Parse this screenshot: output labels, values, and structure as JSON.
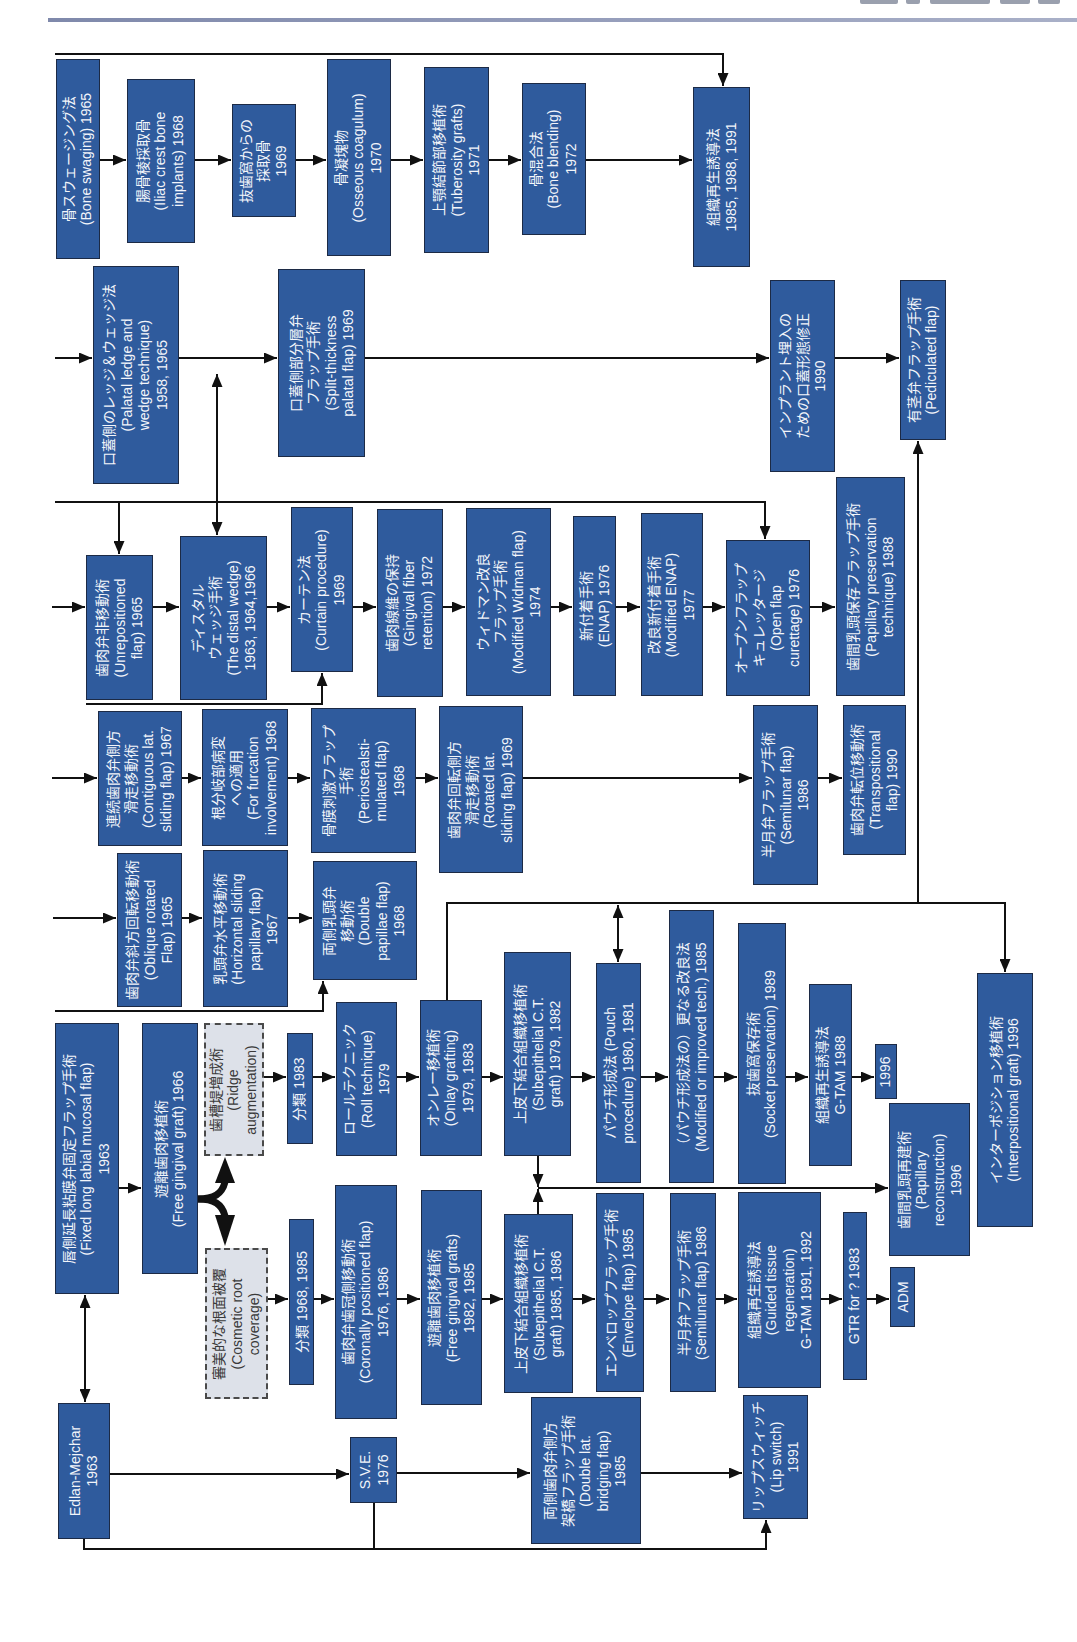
{
  "header": {
    "rule_color": "#8a93b3"
  },
  "colors": {
    "box_fill": "#2f5b9d",
    "box_border": "#1c2a45",
    "box_text": "#f3f5fa",
    "dashed_fill": "#dde1e9",
    "line": "#111111"
  },
  "nodes": {
    "bone_swaging": "骨スウェージング法\n(Bone swaging) 1965",
    "iliac_crest": "腸骨稜採取骨\n(Iliac crest bone\nimplants) 1968",
    "extraction_socket_bone": "抜歯窩からの\n採取骨\n1969",
    "osseous_coagulum": "骨凝塊物\n(Osseous coagulum)\n1970",
    "tuberosity_grafts": "上顎結節部移植術\n(Tuberosity grafts)\n1971",
    "bone_blending": "骨混合法\n(Bone blending)\n1972",
    "gtr_bone": "組織再生誘導法\n1985, 1988, 1991",
    "palatal_ledge_wedge": "口蓋側のレッジ＆ウェッジ法\n(Palatal ledge and\nwedge technique)\n1958, 1965",
    "split_thickness_palatal": "口蓋側部分層弁\nフラップ手術\n(Split-thickness\npalatal flap) 1969",
    "palatal_contour_implant": "インプラント埋入の\nための口蓋形態修正\n1990",
    "pediculated_flap": "有茎弁フラップ手術\n(Pediculated flap)",
    "unrepositioned_flap": "歯肉弁非移動術\n(Unrepositioned\nflap) 1965",
    "distal_wedge": "ディスタル\nウェッジ手術\n(The distal wedge)\n1963, 1964,1966",
    "curtain_procedure": "カーテン法\n(Curtain procedure)\n1969",
    "gingival_fiber_retention": "歯肉線維の保持\n(Gingival fiber\nretention) 1972",
    "modified_widman": "ウィドマン改良\nフラップ手術\n(Modified Widman flap)\n1974",
    "enap": "新付着手術\n(ENAP) 1976",
    "modified_enap": "改良新付着手術\n(Modified ENAP)\n1977",
    "open_flap_curettage": "オープンフラップ\nキュレッタージ\n(Open flap\ncurettage) 1976",
    "papillary_preservation": "歯間乳頭保存フラップ手術\n(Papillary preservation\ntechnique) 1988",
    "contiguous_lat_sliding": "連続歯肉弁側方\n滑走移動術\n(Contiguous lat.\nsliding flap) 1967",
    "furcation_involvement": "根分岐部病変\nへの適用\n(For furcation\ninvolvement) 1968",
    "periosteal_stimulated": "骨膜刺激フラップ\n手術\n(Periostealsti-\nmulated flap)\n1968",
    "rotated_lat_sliding": "歯肉弁回転側方\n滑走移動術\n(Rotated lat.\nsliding flap) 1969",
    "semilunar_flap_upper": "半月弁フラップ手術\n(Semilunar flap)\n1986",
    "transpositional_flap": "歯肉弁転位移動術\n(Transpositional\nflap) 1990",
    "oblique_rotated": "歯肉弁斜方回転移動術\n(Oblique rotated\nFlap) 1965",
    "horizontal_sliding_papillary": "乳頭弁水平移動術\n(Horizontal sliding\npapillary flap)\n1967",
    "double_papillae": "両側乳頭弁\n移動術\n(Double\npapillae flap)\n1968",
    "fixed_long_labial_mucosal": "唇側延長粘膜弁固定フラップ手術\n(Fixed long labial mucosal flap)\n1963",
    "free_gingival_graft": "遊離歯肉移植術\n(Free gingival graft) 1966",
    "ridge_augmentation": "歯槽堤増成術\n(Ridge\naugmentation)",
    "cosmetic_root_coverage": "審美的な根面被覆\n(Cosmetic root\ncoverage)",
    "ridge_classification": "分類 1983",
    "roll_technique": "ロールテクニック\n(Roll technique)\n1979",
    "onlay_grafting": "オンレー移植術\n(Onlay grafting)\n1979, 1983",
    "subepithelial_ct_1979": "上皮下結合組織移植術\n(Subepithelial C.T.\ngraft) 1979, 1982",
    "pouch_procedure": "パウチ形成法 (Pouch\nprocedure) 1980, 1981",
    "modified_pouch": "（パウチ形成法の）更なる改良法\n(Modified or improved tech.) 1985",
    "socket_preservation": "抜歯窩保存術\n(Socket preservation) 1989",
    "gtam_1988": "組織再生誘導法\nG-TAM 1988",
    "ridge_1996": "1996",
    "papillary_reconstruction": "歯間乳頭再建術\n(Papillary\nreconstruction)\n1996",
    "interpositional_graft": "インターポジション移植術\n(Interpositional graft) 1996",
    "root_classification": "分類 1968, 1985",
    "coronally_positioned": "歯肉弁歯冠側移動術\n(Coronally positioned flap)\n1976, 1986",
    "free_gingival_grafts": "遊離歯肉移植術\n(Free gingival grafts)\n1982, 1985",
    "subepithelial_ct_1985": "上皮下結合組織移植術\n(Subepithelial C.T.\ngraft) 1985, 1986",
    "envelope_flap": "エンベロップフラップ手術\n(Envelope flap) 1985",
    "semilunar_flap": "半月弁フラップ手術\n(Semilunar flap) 1986",
    "guided_tissue_regeneration": "組織再生誘導法\n(Guided tissue\nregeneration)\nG-TAM 1991, 1992",
    "gtr_for": "GTR for ? 1983",
    "adm": "ADM",
    "edlan_mejchar": "Edlan-Mejchar\n1963",
    "sve": "S.V.E.\n1976",
    "double_lat_bridging": "両側歯肉弁側方\n架橋フラップ手術\n(Double lat.\nbridging flap)\n1985",
    "lip_switch": "リップスウィッチ\n(Lip switch)\n1991"
  },
  "edges": [
    {
      "from": "bone_swaging",
      "to": "iliac_crest"
    },
    {
      "from": "iliac_crest",
      "to": "extraction_socket_bone"
    },
    {
      "from": "extraction_socket_bone",
      "to": "osseous_coagulum"
    },
    {
      "from": "osseous_coagulum",
      "to": "tuberosity_grafts"
    },
    {
      "from": "tuberosity_grafts",
      "to": "bone_blending"
    },
    {
      "from": "bone_blending",
      "to": "gtr_bone"
    },
    {
      "from": "palatal_ledge_wedge",
      "to": "split_thickness_palatal"
    },
    {
      "from": "split_thickness_palatal",
      "to": "palatal_contour_implant"
    },
    {
      "from": "palatal_contour_implant",
      "to": "pediculated_flap"
    },
    {
      "from": "palatal_ledge_wedge",
      "to": "distal_wedge",
      "bidirectional": true
    },
    {
      "from": "unrepositioned_flap",
      "to": "distal_wedge"
    },
    {
      "from": "distal_wedge",
      "to": "curtain_procedure"
    },
    {
      "from": "curtain_procedure",
      "to": "gingival_fiber_retention"
    },
    {
      "from": "gingival_fiber_retention",
      "to": "modified_widman"
    },
    {
      "from": "modified_widman",
      "to": "enap"
    },
    {
      "from": "enap",
      "to": "modified_enap"
    },
    {
      "from": "modified_enap",
      "to": "open_flap_curettage"
    },
    {
      "from": "open_flap_curettage",
      "to": "papillary_preservation"
    },
    {
      "from": "contiguous_lat_sliding",
      "to": "furcation_involvement"
    },
    {
      "from": "furcation_involvement",
      "to": "periosteal_stimulated"
    },
    {
      "from": "periosteal_stimulated",
      "to": "rotated_lat_sliding"
    },
    {
      "from": "rotated_lat_sliding",
      "to": "semilunar_flap_upper"
    },
    {
      "from": "semilunar_flap_upper",
      "to": "transpositional_flap"
    },
    {
      "from": "oblique_rotated",
      "to": "horizontal_sliding_papillary"
    },
    {
      "from": "horizontal_sliding_papillary",
      "to": "double_papillae"
    },
    {
      "from": "fixed_long_labial_mucosal",
      "to": "free_gingival_graft"
    },
    {
      "from": "free_gingival_graft",
      "to": "ridge_augmentation"
    },
    {
      "from": "free_gingival_graft",
      "to": "cosmetic_root_coverage"
    },
    {
      "from": "ridge_augmentation",
      "to": "ridge_classification"
    },
    {
      "from": "ridge_classification",
      "to": "roll_technique"
    },
    {
      "from": "roll_technique",
      "to": "onlay_grafting"
    },
    {
      "from": "onlay_grafting",
      "to": "subepithelial_ct_1979"
    },
    {
      "from": "subepithelial_ct_1979",
      "to": "pouch_procedure"
    },
    {
      "from": "pouch_procedure",
      "to": "modified_pouch"
    },
    {
      "from": "modified_pouch",
      "to": "socket_preservation"
    },
    {
      "from": "socket_preservation",
      "to": "gtam_1988"
    },
    {
      "from": "gtam_1988",
      "to": "ridge_1996"
    },
    {
      "from": "onlay_grafting",
      "to": "pediculated_flap"
    },
    {
      "from": "onlay_grafting",
      "to": "interpositional_graft"
    },
    {
      "from": "subepithelial_ct_1979",
      "to": "papillary_reconstruction"
    },
    {
      "from": "subepithelial_ct_1985",
      "to": "papillary_reconstruction"
    },
    {
      "from": "cosmetic_root_coverage",
      "to": "root_classification"
    },
    {
      "from": "root_classification",
      "to": "coronally_positioned"
    },
    {
      "from": "coronally_positioned",
      "to": "free_gingival_grafts"
    },
    {
      "from": "free_gingival_grafts",
      "to": "subepithelial_ct_1985"
    },
    {
      "from": "subepithelial_ct_1985",
      "to": "envelope_flap"
    },
    {
      "from": "envelope_flap",
      "to": "semilunar_flap"
    },
    {
      "from": "semilunar_flap",
      "to": "guided_tissue_regeneration"
    },
    {
      "from": "guided_tissue_regeneration",
      "to": "gtr_for"
    },
    {
      "from": "gtr_for",
      "to": "adm"
    },
    {
      "from": "fixed_long_labial_mucosal",
      "to": "edlan_mejchar",
      "bidirectional": true
    },
    {
      "from": "edlan_mejchar",
      "to": "sve"
    },
    {
      "from": "sve",
      "to": "double_lat_bridging"
    },
    {
      "from": "double_lat_bridging",
      "to": "lip_switch"
    },
    {
      "from": "edlan_mejchar",
      "to": "lip_switch"
    },
    {
      "from": "sve",
      "to": "lip_switch"
    }
  ]
}
